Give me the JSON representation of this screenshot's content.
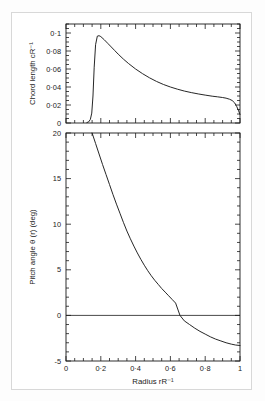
{
  "figure": {
    "background": "#ffffff",
    "ink": "#1a1a1a",
    "border_color": "#d8d8d8"
  },
  "chart_data": [
    {
      "id": "chord-length-panel",
      "type": "line",
      "title": "",
      "xlabel": "",
      "ylabel": "Chord length cR⁻¹",
      "xlim": [
        0,
        1
      ],
      "ylim": [
        0,
        0.11
      ],
      "grid": false,
      "legend": null,
      "xtick_labels": [
        "",
        "",
        "",
        "",
        "",
        ""
      ],
      "xticks": [
        0,
        0.2,
        0.4,
        0.6,
        0.8,
        1
      ],
      "yticks": [
        0,
        0.02,
        0.04,
        0.06,
        0.08,
        0.1
      ],
      "ytick_labels": [
        "0",
        "0·02",
        "0·04",
        "0·06",
        "0·08",
        "0·1"
      ],
      "minor_tick_step_x": 0.05,
      "minor_tick_step_y": 0.005,
      "series": [
        {
          "name": "chord length",
          "x": [
            0.12,
            0.13,
            0.14,
            0.148,
            0.155,
            0.162,
            0.17,
            0.18,
            0.19,
            0.2,
            0.22,
            0.24,
            0.26,
            0.28,
            0.3,
            0.33,
            0.36,
            0.4,
            0.44,
            0.48,
            0.52,
            0.56,
            0.6,
            0.64,
            0.68,
            0.72,
            0.76,
            0.8,
            0.84,
            0.87,
            0.9,
            0.92,
            0.94,
            0.955,
            0.97,
            0.982,
            0.992,
            1.0
          ],
          "y": [
            0.0005,
            0.0012,
            0.004,
            0.011,
            0.03,
            0.062,
            0.087,
            0.0965,
            0.097,
            0.096,
            0.0925,
            0.0885,
            0.0845,
            0.0805,
            0.0765,
            0.071,
            0.066,
            0.06,
            0.0548,
            0.0502,
            0.0462,
            0.0428,
            0.04,
            0.0376,
            0.0355,
            0.0338,
            0.0323,
            0.031,
            0.0298,
            0.0291,
            0.0283,
            0.0276,
            0.0264,
            0.025,
            0.0222,
            0.018,
            0.0135,
            0.0095
          ]
        }
      ]
    },
    {
      "id": "pitch-angle-panel",
      "type": "line",
      "title": "",
      "xlabel": "Radius rR⁻¹",
      "ylabel": "Pitch angle θ (r) (deg)",
      "xlim": [
        0,
        1
      ],
      "ylim": [
        -5,
        20
      ],
      "grid": false,
      "legend": null,
      "xticks": [
        0,
        0.2,
        0.4,
        0.6,
        0.8,
        1
      ],
      "xtick_labels": [
        "0",
        "0·2",
        "0·4",
        "0·6",
        "0·8",
        "1"
      ],
      "yticks": [
        -5,
        0,
        5,
        10,
        15,
        20
      ],
      "ytick_labels": [
        "-5",
        "0",
        "5",
        "10",
        "15",
        "20"
      ],
      "minor_tick_step_x": 0.05,
      "minor_tick_step_y": 1,
      "zero_line": 0,
      "series": [
        {
          "name": "pitch angle",
          "x": [
            0.15,
            0.17,
            0.19,
            0.21,
            0.23,
            0.25,
            0.27,
            0.29,
            0.31,
            0.33,
            0.35,
            0.37,
            0.39,
            0.41,
            0.43,
            0.45,
            0.47,
            0.49,
            0.51,
            0.53,
            0.55,
            0.57,
            0.59,
            0.61,
            0.63,
            0.655,
            0.68,
            0.71,
            0.74,
            0.77,
            0.8,
            0.83,
            0.86,
            0.89,
            0.92,
            0.95,
            0.975,
            1.0
          ],
          "y": [
            20.0,
            18.85,
            17.7,
            16.55,
            15.45,
            14.35,
            13.25,
            12.2,
            11.2,
            10.2,
            9.25,
            8.4,
            7.6,
            6.85,
            6.15,
            5.5,
            4.9,
            4.35,
            3.85,
            3.4,
            2.95,
            2.55,
            2.15,
            1.75,
            1.35,
            0.0,
            -0.6,
            -1.0,
            -1.4,
            -1.75,
            -2.05,
            -2.35,
            -2.6,
            -2.8,
            -3.0,
            -3.15,
            -3.25,
            -3.3
          ]
        }
      ]
    }
  ]
}
